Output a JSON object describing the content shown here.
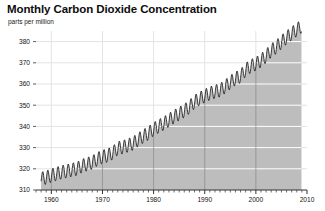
{
  "chart_data": {
    "type": "area",
    "title": "Monthly Carbon Dioxide Concentration",
    "subtitle": "parts per million",
    "xlabel": "",
    "ylabel": "parts per million",
    "ylim": [
      310,
      385
    ],
    "xlim": [
      1957,
      2010
    ],
    "yticks": [
      310,
      320,
      330,
      340,
      350,
      360,
      370,
      380
    ],
    "xticks": [
      1960,
      1970,
      1980,
      1990,
      2000,
      2010
    ],
    "xtick_labels": [
      "1960",
      "1970",
      "1980",
      "1990",
      "2000",
      "2010"
    ],
    "ytick_labels": [
      "310",
      "320",
      "330",
      "340",
      "350",
      "360",
      "370",
      "380"
    ],
    "minor_xtick_interval": 1,
    "grid": "horizontal-and-decadal-vertical",
    "legend": "none",
    "fill_color": "#bdbdbd",
    "line_color": "#111111",
    "gridline_color": "#e3e3e3",
    "inner_gridline_color": "#f2f2f2",
    "axis_color": "#333333",
    "background_color": "#ffffff",
    "series_name": "Monthly mean CO2 (Mauna Loa)",
    "seasonal_amplitude": 3.2,
    "annual_means": {
      "x": [
        1958,
        1959,
        1960,
        1961,
        1962,
        1963,
        1964,
        1965,
        1966,
        1967,
        1968,
        1969,
        1970,
        1971,
        1972,
        1973,
        1974,
        1975,
        1976,
        1977,
        1978,
        1979,
        1980,
        1981,
        1982,
        1983,
        1984,
        1985,
        1986,
        1987,
        1988,
        1989,
        1990,
        1991,
        1992,
        1993,
        1994,
        1995,
        1996,
        1997,
        1998,
        1999,
        2000,
        2001,
        2002,
        2003,
        2004,
        2005,
        2006,
        2007,
        2008
      ],
      "y": [
        315.3,
        315.9,
        316.9,
        317.6,
        318.4,
        318.9,
        319.5,
        320.0,
        321.4,
        322.2,
        323.0,
        324.6,
        325.7,
        326.3,
        327.5,
        329.7,
        330.2,
        331.1,
        332.0,
        333.8,
        335.4,
        336.8,
        338.7,
        340.1,
        341.4,
        343.0,
        344.6,
        346.0,
        347.4,
        349.2,
        351.6,
        353.1,
        354.4,
        355.6,
        356.4,
        357.1,
        358.8,
        360.8,
        362.6,
        363.7,
        366.7,
        368.4,
        369.5,
        371.1,
        373.2,
        375.8,
        377.5,
        379.8,
        381.9,
        383.8,
        385.6
      ]
    }
  }
}
